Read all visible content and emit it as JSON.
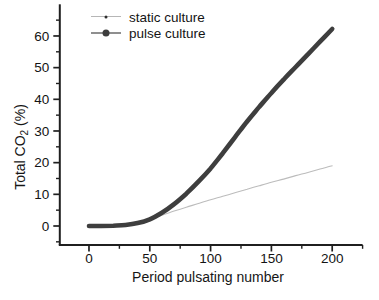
{
  "chart_data": {
    "type": "line",
    "xlabel": "Period pulsating number",
    "ylabel": {
      "pre": "Total CO",
      "sub": "2",
      "post": " (%)"
    },
    "x_axis": {
      "range": [
        -24,
        225
      ],
      "major_ticks": [
        0,
        50,
        100,
        150,
        200
      ],
      "minor_ticks": [
        25,
        75,
        125,
        175,
        225
      ]
    },
    "y_axis": {
      "range": [
        -6,
        70
      ],
      "major_ticks": [
        0,
        10,
        20,
        30,
        40,
        50,
        60
      ],
      "minor_ticks": [
        -5,
        5,
        15,
        25,
        35,
        45,
        55,
        65
      ]
    },
    "legend": {
      "position": "top-inside",
      "entries": [
        {
          "name": "static culture",
          "marker": "small-dot",
          "line_color": "#b6b6b6",
          "marker_color": "#2e2e2e",
          "marker_size": 3,
          "line_thickness": 1
        },
        {
          "name": "pulse culture",
          "marker": "large-dot",
          "line_color": "#8f8f8f",
          "marker_color": "#3d3d3d",
          "marker_size": 7,
          "line_thickness": 1.5
        }
      ]
    },
    "series": [
      {
        "name": "static culture",
        "color": "#bcbcbc",
        "width": 1.1,
        "smooth": true,
        "x": [
          0,
          10,
          20,
          30,
          40,
          50,
          60,
          70,
          80,
          90,
          100,
          110,
          120,
          130,
          140,
          150,
          160,
          170,
          180,
          190,
          200
        ],
        "y": [
          0,
          0.1,
          0.3,
          0.6,
          1.2,
          2.1,
          3.4,
          4.7,
          5.9,
          7.1,
          8.3,
          9.4,
          10.5,
          11.6,
          12.7,
          13.8,
          14.8,
          15.9,
          16.9,
          18.0,
          19.0
        ]
      },
      {
        "name": "pulse culture",
        "color": "#3e3e3e",
        "width": 4.6,
        "smooth": true,
        "x": [
          0,
          10,
          20,
          30,
          40,
          50,
          60,
          70,
          80,
          90,
          100,
          110,
          120,
          130,
          140,
          150,
          160,
          170,
          180,
          190,
          200
        ],
        "y": [
          0,
          0,
          0.1,
          0.3,
          0.9,
          2.1,
          4.2,
          6.9,
          10.2,
          14.0,
          18.2,
          23.0,
          28.0,
          33.0,
          37.6,
          42.0,
          46.2,
          50.2,
          54.2,
          58.2,
          62.2
        ]
      }
    ],
    "colors": {
      "axis": "#1f1f1f",
      "tick_text": "#131313"
    },
    "grid": "off"
  }
}
